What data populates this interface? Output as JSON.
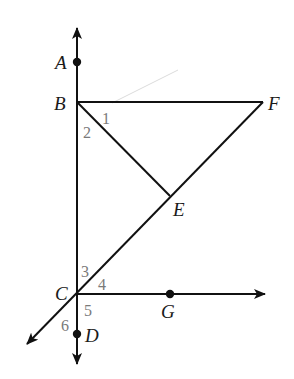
{
  "diagram": {
    "type": "geometry",
    "colors": {
      "line": "#111111",
      "angle_label": "#7a7a7a",
      "point_label": "#1a1a1a",
      "stray_line": "#d8d8d8"
    },
    "points": {
      "A": {
        "label": "A",
        "x": 77,
        "y": 62
      },
      "B": {
        "label": "B",
        "x": 77,
        "y": 102
      },
      "C": {
        "label": "C",
        "x": 77,
        "y": 294
      },
      "D": {
        "label": "D",
        "x": 77,
        "y": 334
      },
      "E": {
        "label": "E",
        "x": 170,
        "y": 196
      },
      "F": {
        "label": "F",
        "x": 263,
        "y": 102
      },
      "G": {
        "label": "G",
        "x": 170,
        "y": 294
      }
    },
    "angles": {
      "a1": "1",
      "a2": "2",
      "a3": "3",
      "a4": "4",
      "a5": "5",
      "a6": "6"
    },
    "segments": [
      "BF",
      "BE",
      "CF",
      "AD line",
      "CG ray",
      "C-lower-left ray"
    ]
  }
}
